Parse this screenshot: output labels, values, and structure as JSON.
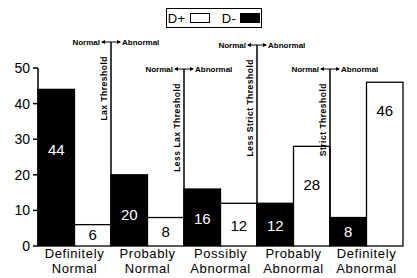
{
  "chart_data": {
    "type": "bar",
    "title": "",
    "xlabel": "",
    "ylabel": "",
    "ylim": [
      0,
      50
    ],
    "yticks": [
      0,
      10,
      20,
      30,
      40,
      50
    ],
    "grid": false,
    "legend_position": "top-center",
    "categories": [
      "Definitely Normal",
      "Probably Normal",
      "Possibly Abnormal",
      "Probably Abnormal",
      "Definitely Abnormal"
    ],
    "category_lines": [
      [
        "Definitely",
        "Normal"
      ],
      [
        "Probably",
        "Normal"
      ],
      [
        "Possibly",
        "Abnormal"
      ],
      [
        "Probably",
        "Abnormal"
      ],
      [
        "Definitely",
        "Abnormal"
      ]
    ],
    "series": [
      {
        "name": "D-",
        "fill": "#000000",
        "label_color": "#ffffff",
        "values": [
          44,
          20,
          16,
          12,
          8
        ]
      },
      {
        "name": "D+",
        "fill": "#ffffff",
        "label_color": "#000000",
        "values": [
          6,
          8,
          12,
          28,
          46
        ]
      }
    ],
    "thresholds": [
      {
        "label": "Lax Threshold",
        "after_category": 0,
        "label_y": 42
      },
      {
        "label": "Less Lax Threshold",
        "after_category": 1,
        "label_y": 69
      },
      {
        "label": "Less Strict Threshold",
        "after_category": 2,
        "label_y": 45
      },
      {
        "label": "Strict Threshold",
        "after_category": 3,
        "label_y": 69
      }
    ],
    "threshold_left_text": "Normal",
    "threshold_right_text": "Abnormal",
    "annotations": [
      "Normal ←→ Abnormal arrows above each threshold line"
    ]
  },
  "legend": {
    "pos_label": "D+",
    "neg_label": "D-"
  }
}
